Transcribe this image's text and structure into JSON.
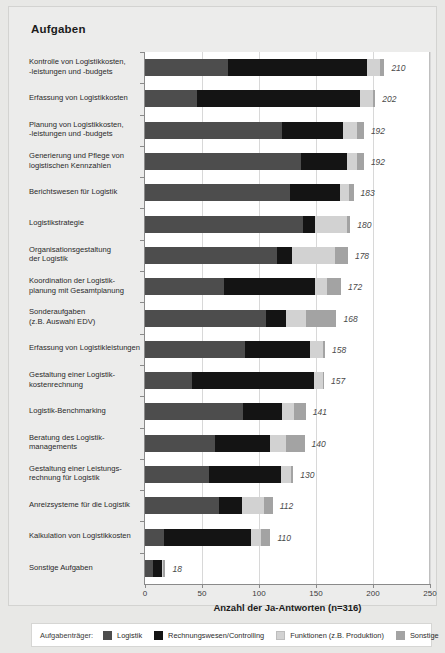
{
  "chart_title": "Aufgaben",
  "axis_caption": "Anzahl der Ja-Antworten (n=316)",
  "legend": {
    "title": "Aufgabenträger:",
    "items": [
      {
        "label": "Logistik",
        "color": "#4d4d4d",
        "key": "logistik"
      },
      {
        "label": "Rechnungswesen/Controlling",
        "color": "#141414",
        "key": "rechnung"
      },
      {
        "label": "Funktionen (z.B. Produktion)",
        "color": "#d2d2d2",
        "key": "funktionen"
      },
      {
        "label": "Sonstige",
        "color": "#a3a3a3",
        "key": "sonstige"
      }
    ]
  },
  "chart_data": {
    "type": "bar",
    "orientation": "horizontal",
    "stacked": true,
    "title": "Aufgaben",
    "xlabel": "Anzahl der Ja-Antworten (n=316)",
    "ylabel": "",
    "xlim": [
      0,
      250
    ],
    "xticks": [
      0,
      50,
      100,
      150,
      200,
      250
    ],
    "xticklabels": [
      "0",
      "50",
      "100",
      "150",
      "200",
      "250"
    ],
    "grid": true,
    "legend_position": "bottom",
    "series": [
      {
        "name": "Logistik",
        "color": "#4d4d4d"
      },
      {
        "name": "Rechnungswesen/Controlling",
        "color": "#141414"
      },
      {
        "name": "Funktionen (z.B. Produktion)",
        "color": "#d2d2d2"
      },
      {
        "name": "Sonstige",
        "color": "#a3a3a3"
      }
    ],
    "categories": [
      "Kontrolle von Logistikkosten, -leistungen und -budgets",
      "Erfassung von Logistikkosten",
      "Planung von Logistikkosten, -leistungen und -budgets",
      "Generierung und Pflege von logistischen Kennzahlen",
      "Berichtswesen für Logistik",
      "Logistikstrategie",
      "Organisationsgestaltung der Logistik",
      "Koordination der Logistik-planung mit Gesamtplanung",
      "Sonderaufgaben (z.B. Auswahl EDV)",
      "Erfassung von Logistikleistungen",
      "Gestaltung einer Logistik-kostenrechnung",
      "Logistik-Benchmarking",
      "Beratung des Logistik-managements",
      "Gestaltung einer Leistungs-rechnung für Logistik",
      "Anreizsysteme für die Logistik",
      "Kalkulation von Logistikkosten",
      "Sonstige Aufgaben"
    ],
    "bars": [
      {
        "label_lines": [
          "Kontrolle von Logistikkosten,",
          "-leistungen und -budgets"
        ],
        "total": 210,
        "segments": [
          73,
          122,
          11,
          4
        ]
      },
      {
        "label_lines": [
          "Erfassung von Logistikkosten"
        ],
        "total": 202,
        "segments": [
          46,
          143,
          11,
          2
        ]
      },
      {
        "label_lines": [
          "Planung von Logistikkosten,",
          "-leistungen und -budgets"
        ],
        "total": 192,
        "segments": [
          120,
          54,
          12,
          6
        ]
      },
      {
        "label_lines": [
          "Generierung und Pflege von",
          "logistischen Kennzahlen"
        ],
        "total": 192,
        "segments": [
          137,
          40,
          9,
          6
        ]
      },
      {
        "label_lines": [
          "Berichtswesen für Logistik"
        ],
        "total": 183,
        "segments": [
          127,
          44,
          8,
          4
        ]
      },
      {
        "label_lines": [
          "Logistikstrategie"
        ],
        "total": 180,
        "segments": [
          139,
          10,
          28,
          3
        ]
      },
      {
        "label_lines": [
          "Organisationsgestaltung",
          "der Logistik"
        ],
        "total": 178,
        "segments": [
          116,
          13,
          38,
          11
        ]
      },
      {
        "label_lines": [
          "Koordination der Logistik-",
          "planung mit Gesamtplanung"
        ],
        "total": 172,
        "segments": [
          69,
          80,
          11,
          12
        ]
      },
      {
        "label_lines": [
          "Sonderaufgaben",
          "(z.B. Auswahl EDV)"
        ],
        "total": 168,
        "segments": [
          106,
          18,
          17,
          27
        ]
      },
      {
        "label_lines": [
          "Erfassung von Logistikleistungen"
        ],
        "total": 158,
        "segments": [
          88,
          57,
          11,
          2
        ]
      },
      {
        "label_lines": [
          "Gestaltung einer Logistik-",
          "kostenrechnung"
        ],
        "total": 157,
        "segments": [
          41,
          107,
          8,
          1
        ]
      },
      {
        "label_lines": [
          "Logistik-Benchmarking"
        ],
        "total": 141,
        "segments": [
          86,
          34,
          11,
          10
        ]
      },
      {
        "label_lines": [
          "Beratung des Logistik-",
          "managements"
        ],
        "total": 140,
        "segments": [
          61,
          49,
          14,
          16
        ]
      },
      {
        "label_lines": [
          "Gestaltung einer Leistungs-",
          "rechnung für Logistik"
        ],
        "total": 130,
        "segments": [
          56,
          63,
          9,
          2
        ]
      },
      {
        "label_lines": [
          "Anreizsysteme für die Logistik"
        ],
        "total": 112,
        "segments": [
          65,
          20,
          19,
          8
        ]
      },
      {
        "label_lines": [
          "Kalkulation von Logistikkosten"
        ],
        "total": 110,
        "segments": [
          17,
          76,
          9,
          8
        ]
      },
      {
        "label_lines": [
          "Sonstige Aufgaben"
        ],
        "total": 18,
        "segments": [
          7,
          8,
          1,
          2
        ]
      }
    ]
  }
}
